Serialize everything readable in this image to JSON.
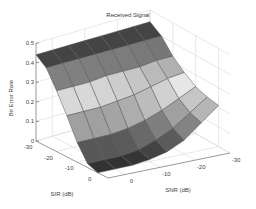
{
  "chart_data": {
    "type": "surface3d",
    "title": "Received Signal",
    "xlabel": "SIR (dB)",
    "ylabel": "SNR (dB)",
    "zlabel": "Bit Error Rate",
    "x_ticks": [
      "-30",
      "-20",
      "-10",
      "0"
    ],
    "y_ticks": [
      "0",
      "-10",
      "-20",
      "-30"
    ],
    "z_ticks": [
      "0",
      "0.1",
      "0.2",
      "0.3",
      "0.4",
      "0.5"
    ],
    "xlim": [
      -30,
      5
    ],
    "ylim": [
      -30,
      5
    ],
    "zlim": [
      0,
      0.5
    ],
    "grid": true,
    "colormap": "gray",
    "sir_values": [
      -30,
      -25,
      -20,
      -15,
      -10,
      -5,
      0
    ],
    "snr_values": [
      -30,
      -25,
      -20,
      -15,
      -10,
      -5,
      0,
      5
    ],
    "z_description": "BER ~0.45 at low SIR (-30 dB) for all SNR, decreasing toward ~0 at high SIR; at low SNR (-30 dB) BER stays elevated (~0.2) even at high SIR",
    "z": [
      [
        0.44,
        0.44,
        0.44,
        0.44,
        0.44,
        0.44,
        0.44,
        0.44
      ],
      [
        0.4,
        0.4,
        0.4,
        0.4,
        0.4,
        0.4,
        0.4,
        0.4
      ],
      [
        0.33,
        0.33,
        0.32,
        0.32,
        0.32,
        0.31,
        0.31,
        0.31
      ],
      [
        0.28,
        0.27,
        0.25,
        0.23,
        0.22,
        0.21,
        0.21,
        0.21
      ],
      [
        0.24,
        0.2,
        0.16,
        0.13,
        0.11,
        0.1,
        0.1,
        0.1
      ],
      [
        0.22,
        0.16,
        0.1,
        0.06,
        0.03,
        0.02,
        0.02,
        0.02
      ],
      [
        0.21,
        0.14,
        0.07,
        0.03,
        0.01,
        0.0,
        0.0,
        0.0
      ]
    ]
  }
}
